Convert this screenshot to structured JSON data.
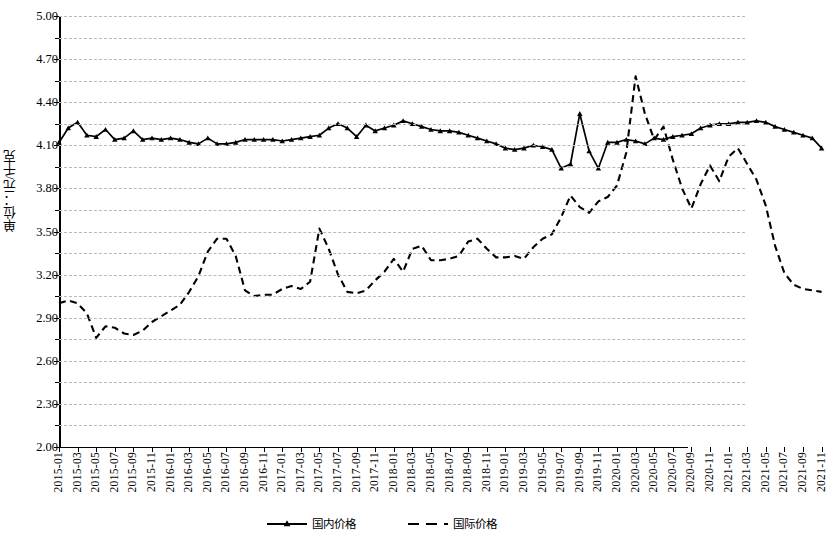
{
  "chart_data": {
    "type": "line",
    "title": "",
    "xlabel": "",
    "ylabel": "单位：元/千克",
    "ylim": [
      2.0,
      5.0
    ],
    "ytick_labels": [
      "5.00",
      "4.70",
      "4.40",
      "4.10",
      "3.80",
      "3.50",
      "3.20",
      "2.90",
      "2.60",
      "2.30",
      "2.00"
    ],
    "ytick_values": [
      5.0,
      4.7,
      4.4,
      4.1,
      3.8,
      3.5,
      3.2,
      2.9,
      2.6,
      2.3,
      2.0
    ],
    "y_minor_step": 0.15,
    "grid": true,
    "legend_position": "bottom",
    "x_tick_labels": [
      "2015-01",
      "2015-03",
      "2015-05",
      "2015-07",
      "2015-09",
      "2015-11",
      "2016-01",
      "2016-03",
      "2016-05",
      "2016-07",
      "2016-09",
      "2016-11",
      "2017-01",
      "2017-03",
      "2017-05",
      "2017-07",
      "2017-09",
      "2017-11",
      "2018-01",
      "2018-03",
      "2018-05",
      "2018-07",
      "2018-09",
      "2018-11",
      "2019-01",
      "2019-03",
      "2019-05",
      "2019-07",
      "2019-09",
      "2019-11",
      "2020-01",
      "2020-03",
      "2020-05",
      "2020-07",
      "2020-09",
      "2020-11",
      "2021-01",
      "2021-03",
      "2021-05",
      "2021-07",
      "2021-09",
      "2021-11"
    ],
    "x": [
      "2015-01",
      "2015-02",
      "2015-03",
      "2015-04",
      "2015-05",
      "2015-06",
      "2015-07",
      "2015-08",
      "2015-09",
      "2015-10",
      "2015-11",
      "2015-12",
      "2016-01",
      "2016-02",
      "2016-03",
      "2016-04",
      "2016-05",
      "2016-06",
      "2016-07",
      "2016-08",
      "2016-09",
      "2016-10",
      "2016-11",
      "2016-12",
      "2017-01",
      "2017-02",
      "2017-03",
      "2017-04",
      "2017-05",
      "2017-06",
      "2017-07",
      "2017-08",
      "2017-09",
      "2017-10",
      "2017-11",
      "2017-12",
      "2018-01",
      "2018-02",
      "2018-03",
      "2018-04",
      "2018-05",
      "2018-06",
      "2018-07",
      "2018-08",
      "2018-09",
      "2018-10",
      "2018-11",
      "2018-12",
      "2019-01",
      "2019-02",
      "2019-03",
      "2019-04",
      "2019-05",
      "2019-06",
      "2019-07",
      "2019-08",
      "2019-09",
      "2019-10",
      "2019-11",
      "2019-12",
      "2020-01",
      "2020-02",
      "2020-03",
      "2020-04",
      "2020-05",
      "2020-06",
      "2020-07",
      "2020-08",
      "2020-09",
      "2020-10",
      "2020-11",
      "2020-12",
      "2021-01",
      "2021-02",
      "2021-03",
      "2021-04",
      "2021-05",
      "2021-06",
      "2021-07",
      "2021-08",
      "2021-09",
      "2021-10",
      "2021-11"
    ],
    "series": [
      {
        "name": "国内价格",
        "style": "solid",
        "marker": "triangle",
        "color": "#000000",
        "values": [
          4.12,
          4.22,
          4.26,
          4.17,
          4.16,
          4.21,
          4.14,
          4.15,
          4.2,
          4.14,
          4.15,
          4.14,
          4.15,
          4.14,
          4.12,
          4.11,
          4.15,
          4.11,
          4.11,
          4.12,
          4.14,
          4.14,
          4.14,
          4.14,
          4.13,
          4.14,
          4.15,
          4.16,
          4.17,
          4.22,
          4.25,
          4.22,
          4.16,
          4.24,
          4.2,
          4.22,
          4.24,
          4.27,
          4.25,
          4.23,
          4.21,
          4.2,
          4.2,
          4.19,
          4.17,
          4.15,
          4.13,
          4.11,
          4.08,
          4.07,
          4.08,
          4.1,
          4.09,
          4.07,
          3.94,
          3.97,
          4.32,
          4.06,
          3.94,
          4.12,
          4.12,
          4.14,
          4.13,
          4.11,
          4.15,
          4.14,
          4.16,
          4.17,
          4.18,
          4.22,
          4.24,
          4.25,
          4.25,
          4.26,
          4.26,
          4.27,
          4.26,
          4.23,
          4.21,
          4.19,
          4.17,
          4.15,
          4.08
        ]
      },
      {
        "name": "国际价格",
        "style": "dashed",
        "marker": "none",
        "color": "#000000",
        "values": [
          3.0,
          3.02,
          3.0,
          2.93,
          2.76,
          2.84,
          2.83,
          2.79,
          2.78,
          2.81,
          2.87,
          2.91,
          2.95,
          2.99,
          3.08,
          3.19,
          3.36,
          3.45,
          3.45,
          3.33,
          3.09,
          3.05,
          3.06,
          3.06,
          3.1,
          3.12,
          3.1,
          3.15,
          3.52,
          3.38,
          3.2,
          3.08,
          3.07,
          3.09,
          3.16,
          3.22,
          3.31,
          3.22,
          3.38,
          3.4,
          3.3,
          3.3,
          3.31,
          3.33,
          3.43,
          3.45,
          3.38,
          3.32,
          3.32,
          3.33,
          3.31,
          3.39,
          3.45,
          3.48,
          3.6,
          3.75,
          3.67,
          3.63,
          3.71,
          3.74,
          3.82,
          4.05,
          4.58,
          4.32,
          4.14,
          4.23,
          4.0,
          3.8,
          3.66,
          3.83,
          3.96,
          3.85,
          4.02,
          4.08,
          3.97,
          3.86,
          3.68,
          3.4,
          3.21,
          3.13,
          3.1,
          3.09,
          3.08
        ]
      }
    ]
  },
  "legend": {
    "items": [
      {
        "label": "国内价格"
      },
      {
        "label": "国际价格"
      }
    ]
  }
}
